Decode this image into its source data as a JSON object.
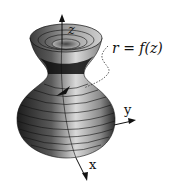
{
  "diagram": {
    "type": "surface-of-revolution",
    "annotation": "r = f(z)",
    "axes": {
      "z": "z",
      "y": "y",
      "x": "x"
    },
    "colors": {
      "background": "#ffffff",
      "surface_dark": "#1a1a1a",
      "surface_mid": "#6e6e6e",
      "surface_light": "#d8d8d8",
      "lines": "#111111"
    }
  }
}
